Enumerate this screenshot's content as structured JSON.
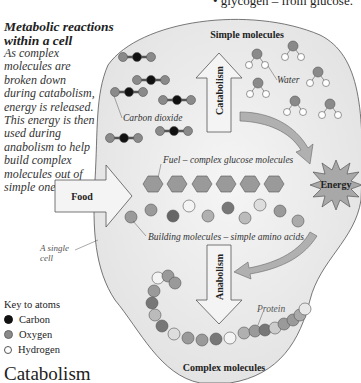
{
  "top_fragment": "• glycogen – from glucose.",
  "sidebar": {
    "heading_line1": "Metabolic reactions",
    "heading_line2": "within a cell",
    "description": "As complex molecules are broken down during catabolism, energy is released. This energy is then used during anabolism to help build complex molecules out of simple ones."
  },
  "diagram": {
    "simple_molecules_label": "Simple molecules",
    "complex_molecules_label": "Complex molecules",
    "catabolism_label": "Catabolism",
    "anabolism_label": "Anabolism",
    "food_label": "Food",
    "energy_label": "Energy",
    "water_label": "Water",
    "carbon_dioxide_label": "Carbon dioxide",
    "fuel_label": "Fuel – complex glucose molecules",
    "building_label": "Building molecules – simple amino acids",
    "protein_label": "Protein",
    "cell_label_line1": "A single",
    "cell_label_line2": "cell"
  },
  "key": {
    "title": "Key to atoms",
    "items": [
      {
        "label": "Carbon",
        "color": "#111111"
      },
      {
        "label": "Oxygen",
        "color": "#8a8a8a"
      },
      {
        "label": "Hydrogen",
        "color": "#ffffff"
      }
    ]
  },
  "section_title": "Catabolism",
  "colors": {
    "cell_fill": "#ececec",
    "oxygen": "#8a8a8a",
    "carbon": "#111111",
    "hydrogen": "#ffffff",
    "arrow_fill": "#f4f4f4",
    "curved_arrow": "#b0b0b0"
  }
}
